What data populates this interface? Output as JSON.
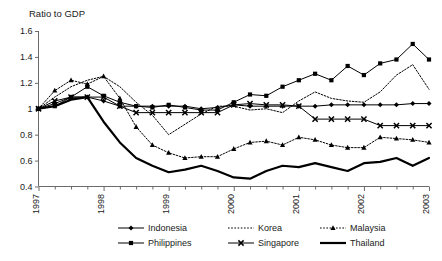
{
  "chart_data": {
    "type": "line",
    "title": "",
    "ylabel": "Ratio to GDP",
    "xlabel": "",
    "ylim": [
      0.4,
      1.6
    ],
    "yticks": [
      0.4,
      0.6,
      0.8,
      1.0,
      1.2,
      1.4,
      1.6
    ],
    "ytick_labels": [
      "0.4",
      "0.6",
      "0.8",
      "1",
      "1.2",
      "1.4",
      "1.6"
    ],
    "xtick_labels": [
      "1997",
      "1998",
      "1999",
      "2000",
      "2001",
      "2002",
      "2003"
    ],
    "x_minor_ticks_per_year": 4,
    "x": [
      1997.0,
      1997.25,
      1997.5,
      1997.75,
      1998.0,
      1998.25,
      1998.5,
      1998.75,
      1999.0,
      1999.25,
      1999.5,
      1999.75,
      2000.0,
      2000.25,
      2000.5,
      2000.75,
      2001.0,
      2001.25,
      2001.5,
      2001.75,
      2002.0,
      2002.25,
      2002.5,
      2002.75,
      2003.0
    ],
    "grid": false,
    "legend_position": "bottom",
    "series": [
      {
        "name": "Indonesia",
        "marker": "diamond",
        "style": "solid",
        "width": 1,
        "values": [
          1.0,
          1.04,
          1.09,
          1.09,
          1.06,
          1.02,
          1.02,
          1.02,
          1.02,
          1.02,
          1.0,
          1.01,
          1.03,
          1.02,
          1.02,
          1.02,
          1.02,
          1.02,
          1.03,
          1.03,
          1.03,
          1.03,
          1.03,
          1.04,
          1.04
        ]
      },
      {
        "name": "Korea",
        "marker": "none",
        "style": "dotted",
        "width": 1,
        "values": [
          1.0,
          1.09,
          1.17,
          1.22,
          1.25,
          1.17,
          1.05,
          0.95,
          0.8,
          0.88,
          0.96,
          1.02,
          1.02,
          0.99,
          1.0,
          0.97,
          1.06,
          1.13,
          1.08,
          1.06,
          1.05,
          1.13,
          1.26,
          1.34,
          1.15
        ]
      },
      {
        "name": "Malaysia",
        "marker": "triangle",
        "style": "dotted",
        "width": 1,
        "values": [
          1.0,
          1.14,
          1.22,
          1.19,
          1.25,
          1.08,
          0.86,
          0.72,
          0.66,
          0.62,
          0.63,
          0.63,
          0.69,
          0.74,
          0.75,
          0.72,
          0.78,
          0.76,
          0.72,
          0.7,
          0.7,
          0.78,
          0.77,
          0.76,
          0.74
        ]
      },
      {
        "name": "Philippines",
        "marker": "square",
        "style": "solid",
        "width": 1,
        "values": [
          1.0,
          1.02,
          1.09,
          1.17,
          1.1,
          1.05,
          1.02,
          1.01,
          1.03,
          1.01,
          0.99,
          0.99,
          1.05,
          1.11,
          1.1,
          1.17,
          1.22,
          1.27,
          1.22,
          1.33,
          1.26,
          1.35,
          1.38,
          1.5,
          1.38
        ]
      },
      {
        "name": "Singapore",
        "marker": "x",
        "style": "solid",
        "width": 1,
        "values": [
          1.0,
          1.06,
          1.09,
          1.09,
          1.09,
          1.02,
          0.97,
          0.97,
          0.97,
          0.97,
          0.97,
          0.97,
          1.03,
          1.04,
          1.03,
          1.03,
          1.02,
          0.92,
          0.92,
          0.92,
          0.92,
          0.87,
          0.87,
          0.87,
          0.87
        ]
      },
      {
        "name": "Thailand",
        "marker": "none",
        "style": "solid",
        "width": 2.2,
        "values": [
          1.0,
          1.02,
          1.07,
          1.09,
          0.9,
          0.74,
          0.62,
          0.56,
          0.51,
          0.53,
          0.56,
          0.52,
          0.47,
          0.46,
          0.52,
          0.56,
          0.55,
          0.58,
          0.55,
          0.52,
          0.58,
          0.59,
          0.62,
          0.56,
          0.62
        ]
      }
    ]
  },
  "legend": {
    "entries": [
      {
        "label": "Indonesia"
      },
      {
        "label": "Korea"
      },
      {
        "label": "Malaysia"
      },
      {
        "label": "Philippines"
      },
      {
        "label": "Singapore"
      },
      {
        "label": "Thailand"
      }
    ]
  }
}
